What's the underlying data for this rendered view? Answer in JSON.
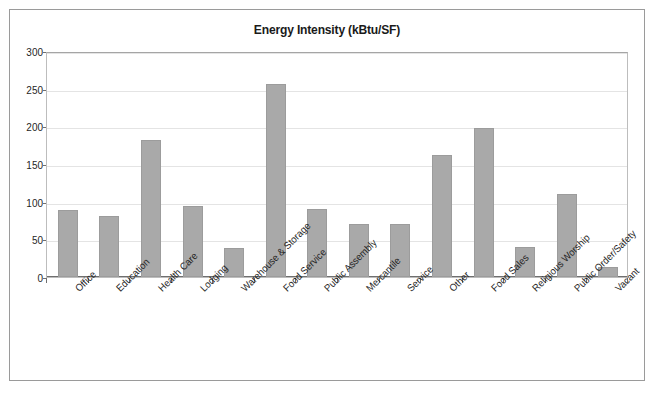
{
  "chart_data": {
    "type": "bar",
    "title": "Energy Intensity (kBtu/SF)",
    "xlabel": "",
    "ylabel": "",
    "ylim": [
      0,
      300
    ],
    "yticks": [
      0,
      50,
      100,
      150,
      200,
      250,
      300
    ],
    "ytick_labels": [
      "0",
      "50",
      "100",
      "150",
      "200",
      "250",
      "300"
    ],
    "grid": true,
    "legend": false,
    "bar_color": "#a9a9a9",
    "categories": [
      "Office",
      "Education",
      "Health Care",
      "Lodging",
      "Warehouse & Storage",
      "Food Service",
      "Public Assembly",
      "Mercantile",
      "Service",
      "Other",
      "Food Sales",
      "Religious Worship",
      "Public Order/Safety",
      "Vacant"
    ],
    "values": [
      89,
      81,
      182,
      94,
      39,
      256,
      90,
      71,
      71,
      162,
      198,
      40,
      110,
      13
    ]
  }
}
